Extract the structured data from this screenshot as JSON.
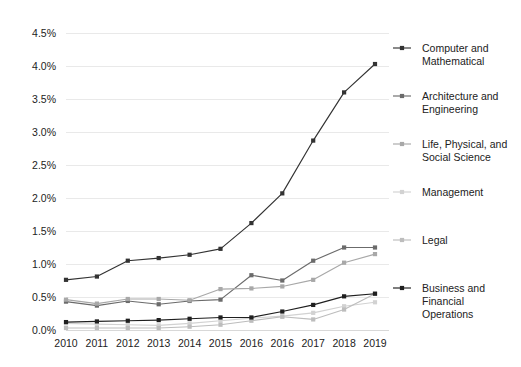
{
  "chart_data": {
    "type": "line",
    "title": "",
    "subtitle": "",
    "xlabel": "",
    "ylabel": "",
    "grid": true,
    "legend_position": "right",
    "categories": [
      "2010",
      "2011",
      "2012",
      "2013",
      "2014",
      "2015",
      "2016",
      "2016",
      "2017",
      "2018",
      "2019"
    ],
    "ytick_labels": [
      "0.0%",
      "0.5%",
      "1.0%",
      "1.5%",
      "2.0%",
      "2.5%",
      "3.0%",
      "3.5%",
      "4.0%",
      "4.5%"
    ],
    "ytick_values": [
      0.0,
      0.5,
      1.0,
      1.5,
      2.0,
      2.5,
      3.0,
      3.5,
      4.0,
      4.5
    ],
    "ylim": [
      0.0,
      4.5
    ],
    "value_suffix": "%",
    "series": [
      {
        "name": "Computer and Mathematical",
        "color": "#333333",
        "values": [
          0.76,
          0.81,
          1.05,
          1.09,
          1.14,
          1.23,
          1.62,
          2.07,
          2.87,
          3.6,
          4.03
        ]
      },
      {
        "name": "Architecture and Engineering",
        "color": "#6b6b6b",
        "values": [
          0.43,
          0.37,
          0.44,
          0.39,
          0.44,
          0.46,
          0.83,
          0.75,
          1.05,
          1.25,
          1.25
        ]
      },
      {
        "name": "Life, Physical, and Social Science",
        "color": "#a8a8a8",
        "values": [
          0.46,
          0.4,
          0.47,
          0.47,
          0.45,
          0.62,
          0.63,
          0.66,
          0.76,
          1.02,
          1.15
        ]
      },
      {
        "name": "Management",
        "color": "#d2d2d2",
        "values": [
          0.1,
          0.09,
          0.08,
          0.07,
          0.1,
          0.14,
          0.18,
          0.21,
          0.26,
          0.36,
          0.42
        ]
      },
      {
        "name": "Legal",
        "color": "#bdbdbd",
        "values": [
          0.03,
          0.03,
          0.03,
          0.03,
          0.05,
          0.08,
          0.14,
          0.2,
          0.16,
          0.31,
          0.55
        ]
      },
      {
        "name": "Business and Financial Operations",
        "color": "#1f1f1f",
        "values": [
          0.12,
          0.13,
          0.14,
          0.15,
          0.17,
          0.19,
          0.19,
          0.28,
          0.38,
          0.51,
          0.55
        ]
      }
    ]
  },
  "legend": {
    "entries": [
      {
        "label_line1": "Computer and",
        "label_line2": "Mathematical",
        "label_line3": ""
      },
      {
        "label_line1": "Architecture and",
        "label_line2": "Engineering",
        "label_line3": ""
      },
      {
        "label_line1": "Life, Physical, and",
        "label_line2": "Social Science",
        "label_line3": ""
      },
      {
        "label_line1": "Management",
        "label_line2": "",
        "label_line3": ""
      },
      {
        "label_line1": "Legal",
        "label_line2": "",
        "label_line3": ""
      },
      {
        "label_line1": "Business and",
        "label_line2": "Financial",
        "label_line3": "Operations"
      }
    ]
  }
}
